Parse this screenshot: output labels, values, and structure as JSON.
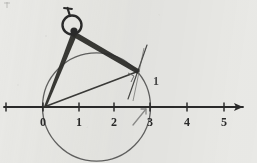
{
  "figure": {
    "medium": "scanned-pencil-drawing",
    "background_color": "#e9e9e6",
    "ink_color": "#2b2b2b",
    "light_ink_color": "#6f6f6f"
  },
  "number_line": {
    "name": "number-line",
    "axis_y": 107,
    "arrow_direction": "right",
    "pixels_per_unit": 36,
    "origin_x": 43,
    "ticks": [
      {
        "value": -1,
        "x": 6,
        "label": ""
      },
      {
        "value": 0,
        "x": 43,
        "label": "0"
      },
      {
        "value": 1,
        "x": 79,
        "label": "1"
      },
      {
        "value": 2,
        "x": 114,
        "label": "2"
      },
      {
        "value": 3,
        "x": 150,
        "label": "3"
      },
      {
        "value": 4,
        "x": 187,
        "label": "4"
      },
      {
        "value": 5,
        "x": 224,
        "label": "5"
      }
    ],
    "labels": [
      "0",
      "1",
      "2",
      "3",
      "4",
      "5"
    ]
  },
  "circle": {
    "name": "construction-circle",
    "center_x": 96.5,
    "center_y": 107,
    "radius": 54,
    "passes_through": [
      "0",
      "3"
    ],
    "clipped_at_bottom": true
  },
  "compass": {
    "name": "compass-tool",
    "hinge_x": 74,
    "hinge_y": 30,
    "head_ring_radius": 9,
    "handle_tip_x": 70,
    "handle_tip_y": 10,
    "pivot_leg_end_x": 44,
    "pivot_leg_end_y": 107,
    "pencil_leg_end_x": 138,
    "pencil_leg_end_y": 72
  },
  "chord": {
    "name": "chord-zero-to-point",
    "from_x": 44,
    "from_y": 107,
    "to_x": 138,
    "to_y": 72
  },
  "tangent": {
    "name": "tangent-line",
    "x1": 146,
    "y1": 46,
    "x2": 129,
    "y2": 97,
    "label": "1",
    "label_x": 155,
    "label_y": 83
  },
  "right_angle_mark": {
    "name": "right-angle-mark",
    "x": 131,
    "y": 76,
    "size": 7
  },
  "pointer_arrow": {
    "name": "pointer-arrow-to-three",
    "x1": 134,
    "y1": 125,
    "x2": 146,
    "y2": 110
  },
  "corner_mark": {
    "name": "faint-corner-mark",
    "x": 3,
    "y": 2,
    "text": ""
  }
}
